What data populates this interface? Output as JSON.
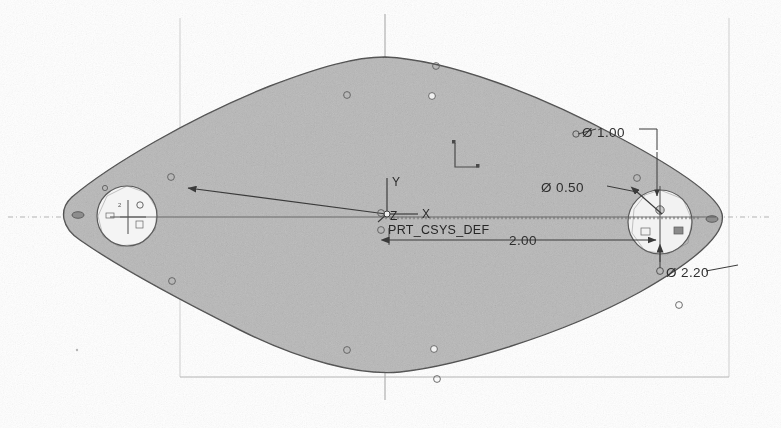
{
  "drawing": {
    "title": "Plate Part Drawing",
    "background_color": "#ffffff",
    "body_fill_color": "#b9b9b9",
    "outline_color": "#4a4a4a",
    "dimension_color": "#2e2e2e",
    "frame_color": "#c8c8c8",
    "centerline_color": "#b0b0b0"
  },
  "coordinate_system": {
    "name": "PRT_CSYS_DEF",
    "axis_x_label": "X",
    "axis_y_label": "Y",
    "axis_z_label": "Z"
  },
  "dimensions": [
    {
      "id": "dim-diameter-1-00",
      "label": "Ø 1.00",
      "symbol": "Ø",
      "value": "1.00",
      "kind": "diameter",
      "x": 580,
      "y": 132
    },
    {
      "id": "dim-diameter-0-50",
      "label": "Ø 0.50",
      "symbol": "Ø",
      "value": "0.50",
      "kind": "diameter",
      "x": 540,
      "y": 187
    },
    {
      "id": "dim-linear-2-00",
      "label": "2.00",
      "symbol": "",
      "value": "2.00",
      "kind": "linear",
      "x": 509,
      "y": 248
    },
    {
      "id": "dim-diameter-2-20",
      "label": "Ø 2.20",
      "symbol": "Ø",
      "value": "2.20",
      "kind": "diameter",
      "x": 672,
      "y": 274
    }
  ],
  "hubs": [
    {
      "id": "hub-left",
      "cx": 127,
      "cy": 216,
      "r": 30,
      "label": "2"
    },
    {
      "id": "hub-right",
      "cx": 660,
      "cy": 222,
      "r": 32,
      "label": ""
    }
  ],
  "frame": {
    "left": 180,
    "right": 729,
    "bottom": 377,
    "top": 18
  },
  "centerlines": {
    "horizontal_y": 217,
    "vertical_x": 385
  },
  "vertex_markers": [
    {
      "cx": 436,
      "cy": 66
    },
    {
      "cx": 347,
      "cy": 95
    },
    {
      "cx": 432,
      "cy": 96
    },
    {
      "cx": 171,
      "cy": 177
    },
    {
      "cx": 130,
      "cy": 184
    },
    {
      "cx": 637,
      "cy": 178
    },
    {
      "cx": 78,
      "cy": 214
    },
    {
      "cx": 713,
      "cy": 219
    },
    {
      "cx": 172,
      "cy": 281
    },
    {
      "cx": 679,
      "cy": 305
    },
    {
      "cx": 347,
      "cy": 350
    },
    {
      "cx": 434,
      "cy": 349
    },
    {
      "cx": 437,
      "cy": 379
    }
  ]
}
